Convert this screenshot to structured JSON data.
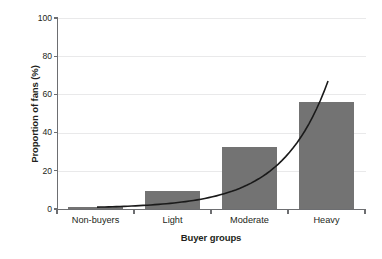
{
  "chart_data": {
    "type": "bar",
    "title": "",
    "subtitle": "",
    "xlabel": "Buyer groups",
    "ylabel": "Proportion of fans (%)",
    "categories": [
      "Non-buyers",
      "Light",
      "Moderate",
      "Heavy"
    ],
    "values": [
      1,
      9.5,
      32.5,
      56
    ],
    "series": [
      {
        "name": "Proportion of fans",
        "type": "bar",
        "values": [
          1,
          9.5,
          32.5,
          56
        ]
      },
      {
        "name": "Trend curve",
        "type": "line",
        "x": [
          "Non-buyers",
          "Light",
          "Moderate",
          "Heavy"
        ],
        "values": [
          1,
          8,
          21,
          67
        ]
      }
    ],
    "ylim": [
      0,
      100
    ],
    "yticks": [
      0,
      20,
      40,
      60,
      80,
      100
    ],
    "ytick_labels": [
      "0",
      "20",
      "40",
      "60",
      "80",
      "100"
    ],
    "grid": true,
    "grid_axis": "y",
    "legend": false,
    "legend_position": "none",
    "bar_color": "#737373",
    "curve_color": "#1a1a1a",
    "axis_color": "#6d6e71",
    "grid_color": "#e9e9ea",
    "background_color": "#ffffff",
    "annotations": []
  },
  "axes": {
    "y_title": "Proportion of fans (%)",
    "x_title": "Buyer groups"
  }
}
